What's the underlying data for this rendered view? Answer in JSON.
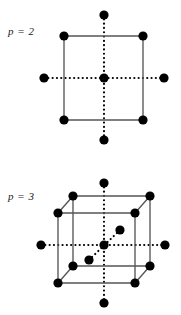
{
  "figure": {
    "title": "",
    "colors": {
      "node": "#000000",
      "edge": "#555555",
      "dotted_axis": "#000000",
      "background": "#ffffff",
      "text": "#1a1a1a"
    },
    "panels": [
      {
        "id": "panel-p2",
        "label": "p = 2",
        "label_x": 8,
        "label_y": 25,
        "shape": "square",
        "node_count": 9,
        "description": "2-dimensional stencil: square with 4 corner nodes, 1 center node, and 4 axis nodes on dotted cross",
        "square": {
          "left": 64,
          "top": 36,
          "right": 143,
          "bottom": 120
        },
        "center": {
          "x": 104,
          "y": 78
        },
        "axis_nodes": [
          {
            "name": "top",
            "x": 104,
            "y": 15
          },
          {
            "name": "bottom",
            "x": 104,
            "y": 140
          },
          {
            "name": "left",
            "x": 44,
            "y": 78
          },
          {
            "name": "right",
            "x": 164,
            "y": 78
          }
        ],
        "corner_nodes": [
          {
            "name": "top-left",
            "x": 64,
            "y": 36
          },
          {
            "name": "top-right",
            "x": 143,
            "y": 36
          },
          {
            "name": "bottom-left",
            "x": 64,
            "y": 120
          },
          {
            "name": "bottom-right",
            "x": 143,
            "y": 120
          }
        ],
        "node_radius": 4.6
      },
      {
        "id": "panel-p3",
        "label": "p = 3",
        "label_x": 8,
        "label_y": 190,
        "shape": "cube",
        "node_count": 15,
        "description": "3-dimensional stencil: cube with 8 corner nodes, 1 center node, and 6 axis nodes on three dotted axes",
        "cube": {
          "front": {
            "left": 58,
            "top": 213,
            "right": 135,
            "bottom": 283
          },
          "back": {
            "left": 73,
            "top": 196,
            "right": 150,
            "bottom": 266
          }
        },
        "center": {
          "x": 104,
          "y": 245
        },
        "axis_nodes": [
          {
            "name": "top",
            "x": 104,
            "y": 183
          },
          {
            "name": "bottom",
            "x": 104,
            "y": 303
          },
          {
            "name": "left",
            "x": 41,
            "y": 245
          },
          {
            "name": "right",
            "x": 165,
            "y": 245
          },
          {
            "name": "front-depth",
            "x": 89,
            "y": 260
          },
          {
            "name": "back-depth",
            "x": 120,
            "y": 230
          }
        ],
        "corner_nodes": [
          {
            "name": "front-top-left",
            "x": 58,
            "y": 213
          },
          {
            "name": "front-top-right",
            "x": 135,
            "y": 213
          },
          {
            "name": "front-bottom-left",
            "x": 58,
            "y": 283
          },
          {
            "name": "front-bottom-right",
            "x": 135,
            "y": 283
          },
          {
            "name": "back-top-left",
            "x": 73,
            "y": 196
          },
          {
            "name": "back-top-right",
            "x": 150,
            "y": 196
          },
          {
            "name": "back-bottom-left",
            "x": 73,
            "y": 266
          },
          {
            "name": "back-bottom-right",
            "x": 150,
            "y": 266
          }
        ],
        "node_radius": 4.6
      }
    ]
  }
}
